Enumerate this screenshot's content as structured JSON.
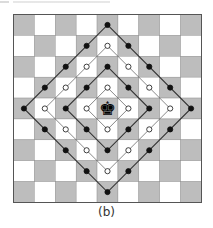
{
  "figure": {
    "caption": "(b)",
    "board": {
      "size": 9,
      "square_px": 20.9,
      "colors": {
        "dark": "#bdbdbd",
        "light": "#ffffff",
        "border": "#555555",
        "line": "#333333",
        "dot_fill_black": "#111111",
        "dot_fill_white": "#ffffff"
      },
      "dark_parity": "even",
      "piece": {
        "type": "king",
        "color": "black",
        "glyph": "♚",
        "row": 4,
        "col": 4
      },
      "rings": [
        {
          "distance": 1,
          "dot": "white"
        },
        {
          "distance": 2,
          "dot": "black"
        },
        {
          "distance": 3,
          "dot": "white"
        },
        {
          "distance": 4,
          "dot": "black"
        }
      ]
    }
  }
}
